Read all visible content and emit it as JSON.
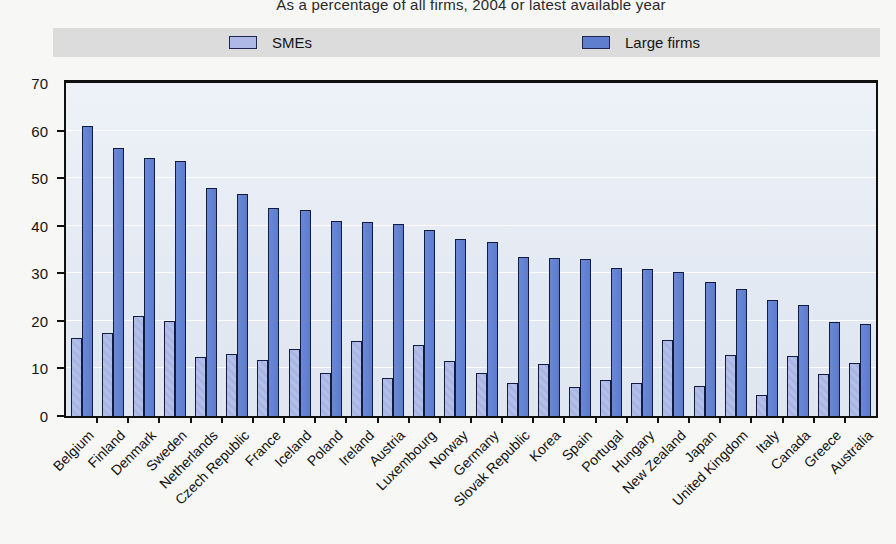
{
  "title": "As a percentage of all firms, 2004 or latest available year",
  "legend": {
    "sme_label": "SMEs",
    "large_label": "Large firms",
    "position": "top"
  },
  "colors": {
    "sme_fill": "#aeb9e6",
    "large_fill": "#5f7ecd",
    "bar_border": "#131c40",
    "plot_background": "#e4eaf3",
    "gridline": "#ffffff",
    "legend_band": "#dcdcdc"
  },
  "chart_data": {
    "type": "bar",
    "title": "As a percentage of all firms, 2004 or latest available year",
    "xlabel": "",
    "ylabel": "",
    "ylim": [
      0,
      70
    ],
    "yticks": [
      0,
      10,
      20,
      30,
      40,
      50,
      60,
      70
    ],
    "grid": true,
    "legend_position": "top",
    "categories": [
      "Belgium",
      "Finland",
      "Denmark",
      "Sweden",
      "Netherlands",
      "Czech Republic",
      "France",
      "Iceland",
      "Poland",
      "Ireland",
      "Austria",
      "Luxembourg",
      "Norway",
      "Germany",
      "Slovak Republic",
      "Korea",
      "Spain",
      "Portugal",
      "Hungary",
      "New Zealand",
      "Japan",
      "United Kingdom",
      "Italy",
      "Canada",
      "Greece",
      "Australia"
    ],
    "series": [
      {
        "name": "SMEs",
        "values": [
          16.5,
          17.5,
          21,
          20,
          12.5,
          13,
          11.8,
          14,
          9,
          15.7,
          8,
          15,
          11.5,
          9,
          7,
          11,
          6,
          7.5,
          7,
          16,
          6.3,
          12.8,
          4.5,
          12.7,
          8.8,
          11.2
        ]
      },
      {
        "name": "Large firms",
        "values": [
          61,
          56.3,
          54.2,
          53.7,
          48,
          46.6,
          43.7,
          43.4,
          41,
          40.7,
          40.3,
          39,
          37.2,
          36.5,
          33.5,
          33.3,
          33,
          31.2,
          31,
          30.2,
          28.2,
          26.7,
          24.3,
          23.3,
          19.7,
          19.4
        ]
      }
    ]
  }
}
